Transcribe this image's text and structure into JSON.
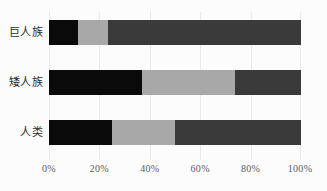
{
  "chart_data": {
    "type": "bar",
    "orientation": "horizontal",
    "stacked": true,
    "normalized": true,
    "title": "",
    "subtitle": "",
    "xlabel": "",
    "ylabel": "",
    "categories": [
      "巨人族",
      "矮人族",
      "人类"
    ],
    "series": [
      {
        "name": "series-1",
        "color": "#0a0a0a",
        "values": [
          11.5,
          37.0,
          25.0
        ]
      },
      {
        "name": "series-2",
        "color": "#a8a8a8",
        "values": [
          12.0,
          37.0,
          25.0
        ]
      },
      {
        "name": "series-3",
        "color": "#3a3a3a",
        "values": [
          76.5,
          26.0,
          50.0
        ]
      }
    ],
    "x_ticks": [
      0,
      20,
      40,
      60,
      80,
      100
    ],
    "x_tick_labels": [
      "0%",
      "20%",
      "40%",
      "60%",
      "80%",
      "100%"
    ],
    "xlim": [
      0,
      100
    ],
    "grid": true,
    "grid_axis": "x",
    "legend": false,
    "legend_position": "none",
    "background_color": "#fcfcfc",
    "gridline_color": "#e9e9e9",
    "tick_label_color": "#5a5a5a",
    "category_label_color": "#2b2b2b"
  }
}
